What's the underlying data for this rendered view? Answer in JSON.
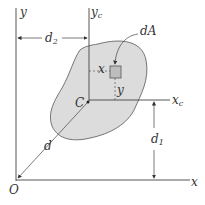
{
  "figure": {
    "type": "parallel-axis-theorem diagram",
    "colors": {
      "area_fill": "#dcdcdc",
      "outline": "#555555",
      "axis": "#444444",
      "element_fill": "#bdbdbd",
      "text": "#333333"
    },
    "labels": {
      "y_axis": "y",
      "x_axis": "x",
      "origin": "O",
      "yc_axis": "y",
      "yc_sub": "c",
      "xc_axis": "x",
      "xc_sub": "c",
      "centroid": "C",
      "area_element": "dA",
      "d2": "d",
      "d2_sub": "2",
      "d1": "d",
      "d1_sub": "1",
      "distance_d": "d",
      "local_x": "x",
      "local_y": "y"
    }
  }
}
